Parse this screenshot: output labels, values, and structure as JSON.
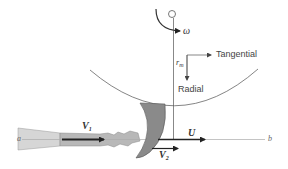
{
  "diagram": {
    "labels": {
      "omega": "ω",
      "r_m": "r",
      "r_m_sub": "m",
      "tangential": "Tangential",
      "radial": "Radial",
      "v1": "V",
      "v1_sub": "1",
      "v2": "V",
      "v2_sub": "2",
      "u": "U",
      "a": "a",
      "b": "b"
    },
    "colors": {
      "line": "#555555",
      "wheel_arc": "#666666",
      "bucket_fill": "#8a8a8a",
      "nozzle_fill": "#d6d6d6",
      "jet_fill": "#b8b8b8",
      "arrow_dark": "#222222",
      "centerline": "#aaaaaa"
    }
  }
}
